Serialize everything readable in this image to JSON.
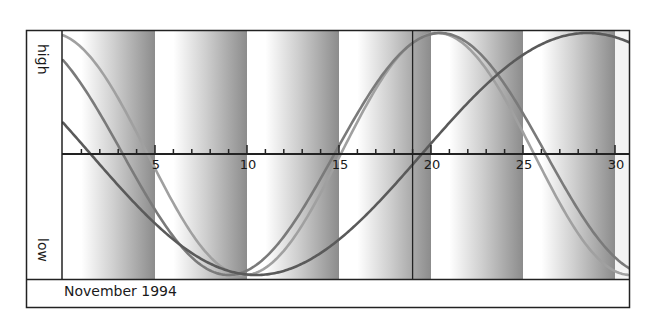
{
  "chart_data": {
    "type": "line",
    "title": "",
    "xlabel": "November 1994",
    "ylabel_top": "high",
    "ylabel_bottom": "low",
    "x_range": [
      0,
      30.9
    ],
    "y_range": [
      -1,
      1
    ],
    "x_ticks_minor_step": 1,
    "x_tick_labels": [
      {
        "x": 5,
        "label": "5"
      },
      {
        "x": 10,
        "label": "10"
      },
      {
        "x": 15,
        "label": "15"
      },
      {
        "x": 20,
        "label": "20"
      },
      {
        "x": 25,
        "label": "25"
      },
      {
        "x": 30,
        "label": "30"
      }
    ],
    "marker_line_x": 19,
    "shaded_bands": [
      {
        "from": 0,
        "to": 5
      },
      {
        "from": 5,
        "to": 10
      },
      {
        "from": 10,
        "to": 15
      },
      {
        "from": 15,
        "to": 20
      },
      {
        "from": 20,
        "to": 25
      },
      {
        "from": 25,
        "to": 30
      }
    ],
    "grid": false,
    "legend": "none",
    "series": [
      {
        "name": "curve-light",
        "period_days": 21,
        "peak_day": 20.35,
        "color": "#a0a0a0",
        "width": 2.6,
        "values_sampled": {
          "x": [
            0,
            5,
            10,
            15,
            20,
            25,
            30
          ],
          "y": [
            0.98,
            -0.1,
            -1.0,
            0.01,
            0.99,
            -0.3,
            -0.85
          ]
        }
      },
      {
        "name": "curve-medium",
        "period_days": 23,
        "peak_day": 20.5,
        "color": "#7a7a7a",
        "width": 2.6,
        "values_sampled": {
          "x": [
            0,
            5,
            10,
            15,
            20,
            25,
            30
          ],
          "y": [
            0.78,
            -0.46,
            -0.96,
            0.07,
            0.99,
            0.34,
            -0.75
          ]
        }
      },
      {
        "name": "curve-dark",
        "period_days": 36,
        "peak_day": 28.5,
        "color": "#5a5a5a",
        "width": 2.6,
        "values_sampled": {
          "x": [
            0,
            5,
            10,
            15,
            20,
            25,
            30
          ],
          "y": [
            0.26,
            -0.57,
            -0.99,
            -0.77,
            0.09,
            0.82,
            0.99
          ]
        }
      }
    ]
  },
  "labels": {
    "high": "high",
    "low": "low",
    "month": "November 1994"
  },
  "colors": {
    "frame": "#222222",
    "band_dark": "#8c8c8c",
    "band_light": "#ffffff"
  }
}
